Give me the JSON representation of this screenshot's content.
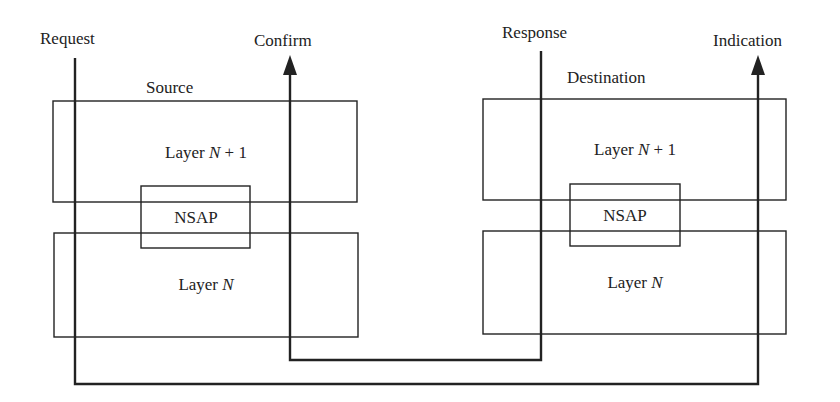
{
  "diagram": {
    "title": "",
    "colors": {
      "stroke": "#222222",
      "background": "#ffffff"
    },
    "primitives": {
      "request": "Request",
      "confirm": "Confirm",
      "response": "Response",
      "indication": "Indication"
    },
    "source": {
      "label": "Source",
      "upper_layer": {
        "prefix": "Layer ",
        "var": "N",
        "suffix": " + 1"
      },
      "sap": "NSAP",
      "lower_layer": {
        "prefix": "Layer ",
        "var": "N",
        "suffix": ""
      }
    },
    "destination": {
      "label": "Destination",
      "upper_layer": {
        "prefix": "Layer ",
        "var": "N",
        "suffix": " + 1"
      },
      "sap": "NSAP",
      "lower_layer": {
        "prefix": "Layer ",
        "var": "N",
        "suffix": ""
      }
    },
    "flows": [
      {
        "from": "Request",
        "to": "Indication",
        "path": "Source down, across bottom, up Destination"
      },
      {
        "from": "Response",
        "to": "Confirm",
        "path": "Destination down, across, up Source"
      }
    ]
  }
}
